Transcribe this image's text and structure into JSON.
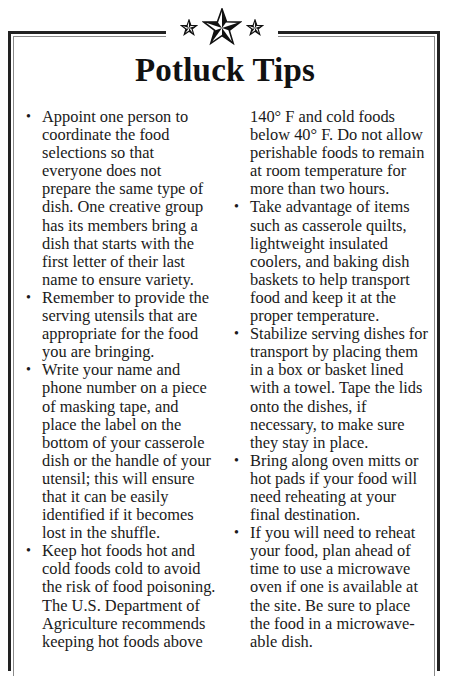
{
  "ornament": {
    "icons": [
      "small-star-icon",
      "large-nautical-star-icon",
      "small-star-icon"
    ]
  },
  "title": "Potluck Tips",
  "colors": {
    "text": "#1a1a1a",
    "frame_outer": "#222222",
    "frame_inner": "#8a8a8a",
    "background": "#ffffff"
  },
  "bullet_glyph": "•",
  "left_column": {
    "tips": [
      {
        "lines": [
          "Appoint one person to",
          "coordinate the food",
          "selections so that",
          "everyone does not",
          "prepare the same type of",
          "dish. One creative group",
          "has its members bring a",
          "dish that starts with the",
          "first letter of their last",
          "name to ensure variety."
        ]
      },
      {
        "lines": [
          "Remember to provide the",
          "serving utensils that are",
          "appropriate for the food",
          "you are bringing."
        ]
      },
      {
        "lines": [
          "Write your name and",
          "phone number on a piece",
          "of masking tape, and",
          "place the label on the",
          "bottom of your casserole",
          "dish or the handle of your",
          "utensil; this will ensure",
          "that it can be easily",
          "identified if it becomes",
          "lost in the shuffle."
        ]
      },
      {
        "lines": [
          "Keep hot foods hot and",
          "cold foods cold to avoid",
          "the risk of food poisoning.",
          "The U.S. Department of",
          "Agriculture recommends",
          "keeping hot foods above"
        ]
      }
    ]
  },
  "right_column": {
    "continuation_lines": [
      "140° F and cold foods",
      "below 40° F. Do not allow",
      "perishable foods to remain",
      "at room temperature for",
      "more than two hours."
    ],
    "tips": [
      {
        "lines": [
          "Take advantage of items",
          "such as casserole quilts,",
          "lightweight insulated",
          "coolers, and baking dish",
          "baskets to help transport",
          "food and keep it at the",
          "proper temperature."
        ]
      },
      {
        "lines": [
          "Stabilize serving dishes for",
          "transport by placing them",
          "in a box or basket lined",
          "with a towel. Tape the lids",
          "onto the dishes, if",
          "necessary, to make sure",
          "they stay in place."
        ]
      },
      {
        "lines": [
          "Bring along oven mitts or",
          "hot pads if your food will",
          "need reheating at your",
          "final destination."
        ]
      },
      {
        "lines": [
          "If you will need to reheat",
          "your food, plan ahead of",
          "time to use a microwave",
          "oven if one is available at",
          "the site. Be sure to place",
          "the food in a microwave-",
          "able dish."
        ]
      }
    ]
  }
}
